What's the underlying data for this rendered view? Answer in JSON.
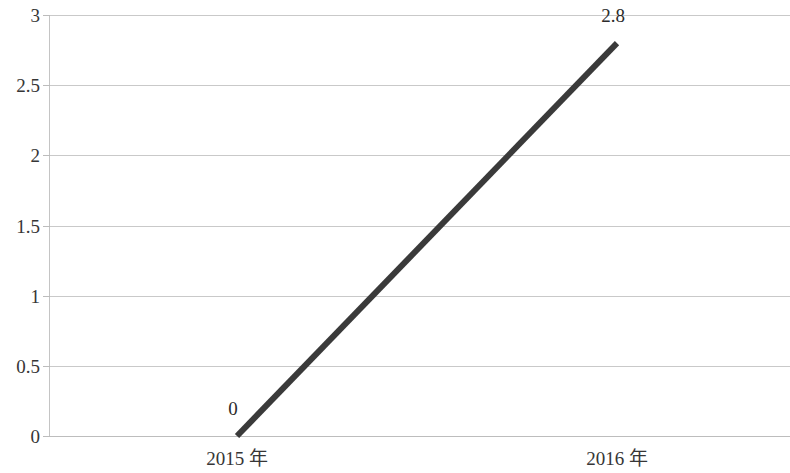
{
  "chart_data": {
    "type": "line",
    "title": "",
    "subtitle": "",
    "xlabel": "",
    "ylabel": "",
    "categories": [
      "2015 年",
      "2016 年"
    ],
    "series": [
      {
        "name": "",
        "values": [
          0,
          2.8
        ],
        "color": "#3a3a3a",
        "line_width": 6,
        "data_labels": [
          "0",
          "2.8"
        ]
      }
    ],
    "ylim": [
      0,
      3
    ],
    "ytick_values": [
      0,
      0.5,
      1,
      1.5,
      2,
      2.5,
      3
    ],
    "ytick_labels": [
      "0",
      "0.5",
      "1",
      "1.5",
      "2",
      "2.5",
      "3"
    ],
    "grid": true,
    "grid_axis": "y",
    "grid_color": "#c9c9c9",
    "legend": false,
    "legend_position": "none",
    "background_color": "#ffffff",
    "axis_color": "#c4c4c4",
    "text_color": "#363636"
  },
  "labels": {
    "y_0": "0",
    "y_1": "0.5",
    "y_2": "1",
    "y_3": "1.5",
    "y_4": "2",
    "y_5": "2.5",
    "y_6": "3",
    "x_0": "2015 年",
    "x_1": "2016 年",
    "point_0": "0",
    "point_1": "2.8"
  }
}
